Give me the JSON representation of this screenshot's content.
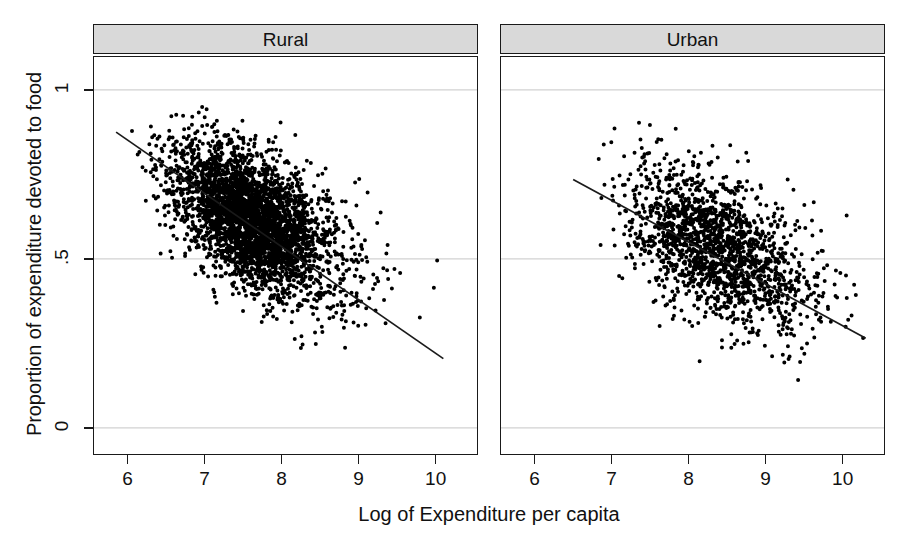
{
  "axes": {
    "y_title": "Proportion of expenditure devoted to food",
    "x_title": "Log of Expenditure per capita",
    "y_ticks": [
      "0",
      ".5",
      "1"
    ],
    "x_ticks": [
      "6",
      "7",
      "8",
      "9",
      "10"
    ]
  },
  "panels": [
    {
      "label": "Rural"
    },
    {
      "label": "Urban"
    }
  ],
  "colors": {
    "point": "#000000",
    "line": "#1a1a1a",
    "grid": "#d2d2d2",
    "strip_fill": "#d9d9d9",
    "border": "#1a1a1a"
  },
  "chart_data": {
    "type": "scatter",
    "title": "",
    "xlabel": "Log of Expenditure per capita",
    "ylabel": "Proportion of expenditure devoted to food",
    "xlim": [
      5.55,
      10.55
    ],
    "ylim": [
      -0.08,
      1.1
    ],
    "xticks": [
      6,
      7,
      8,
      9,
      10
    ],
    "yticks": [
      0,
      0.5,
      1
    ],
    "ytick_labels": [
      "0",
      ".5",
      "1"
    ],
    "grid": "horizontal-only",
    "legend": "none",
    "panel_variable": "Sector",
    "series": [
      {
        "name": "Rural",
        "panel": "Rural",
        "n_points": 3400,
        "marker": "filled-circle",
        "marker_size_px": 2.0,
        "x_mean": 7.62,
        "y_mean": 0.615,
        "x_sd": 0.52,
        "y_sd": 0.115,
        "correlation": -0.52,
        "x_range": [
          5.8,
          10.15
        ],
        "y_range": [
          0.1,
          0.95
        ],
        "fit_line": {
          "type": "linear",
          "x_start": 5.85,
          "y_start": 0.875,
          "x_end": 10.1,
          "y_end": 0.205,
          "slope": -0.158,
          "intercept": 1.799
        }
      },
      {
        "name": "Urban",
        "panel": "Urban",
        "n_points": 1750,
        "marker": "filled-circle",
        "marker_size_px": 2.0,
        "x_mean": 8.33,
        "y_mean": 0.535,
        "x_sd": 0.6,
        "y_sd": 0.125,
        "correlation": -0.5,
        "x_range": [
          6.8,
          10.35
        ],
        "y_range": [
          0.07,
          0.92
        ],
        "fit_line": {
          "type": "linear",
          "x_start": 6.5,
          "y_start": 0.735,
          "x_end": 10.3,
          "y_end": 0.265,
          "slope": -0.1237,
          "intercept": 1.539
        }
      }
    ]
  }
}
